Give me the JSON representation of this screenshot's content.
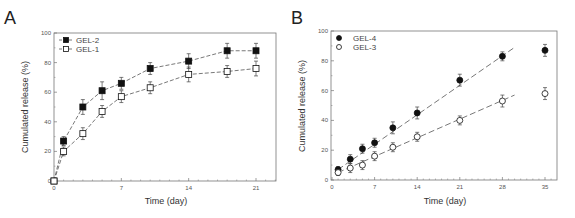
{
  "chart_data": [
    {
      "panel": "A",
      "type": "line",
      "title": "",
      "xlabel": "Time (day)",
      "ylabel": "Cumulated release (%)",
      "xlim": [
        0,
        24
      ],
      "ylim": [
        0,
        100
      ],
      "xticks": [
        0,
        7,
        14,
        21
      ],
      "yticks": [
        0,
        20,
        40,
        60,
        80,
        100
      ],
      "grid": false,
      "legend_position": "upper-left",
      "series": [
        {
          "name": "GEL-2",
          "marker": "filled-square",
          "line": "dashed",
          "x": [
            0,
            1,
            3,
            5,
            7,
            10,
            14,
            18,
            21
          ],
          "y": [
            0,
            27,
            50,
            61,
            66,
            76,
            81,
            88,
            88
          ],
          "err": [
            0,
            3,
            5,
            6,
            4,
            4,
            5,
            5,
            5
          ]
        },
        {
          "name": "GEL-1",
          "marker": "open-square",
          "line": "dashed",
          "x": [
            0,
            1,
            3,
            5,
            7,
            10,
            14,
            18,
            21
          ],
          "y": [
            0,
            20,
            32,
            47,
            57,
            63,
            72,
            74,
            76
          ],
          "err": [
            0,
            3,
            4,
            4,
            4,
            4,
            5,
            4,
            5
          ]
        }
      ],
      "frame": {
        "left": 54,
        "top": 33,
        "right": 276,
        "bottom": 181,
        "x0px": 54,
        "x21px": 256
      }
    },
    {
      "panel": "B",
      "type": "scatter",
      "title": "",
      "xlabel": "Time (day)",
      "ylabel": "Cumulated release (%)",
      "xlim": [
        0,
        37
      ],
      "ylim": [
        0,
        100
      ],
      "xticks": [
        0,
        7,
        14,
        21,
        28,
        35
      ],
      "yticks": [
        0,
        20,
        40,
        60,
        80,
        100
      ],
      "grid": false,
      "legend_position": "upper-left",
      "series": [
        {
          "name": "GEL-4",
          "marker": "filled-circle",
          "x": [
            1,
            3,
            5,
            7,
            10,
            14,
            21,
            28,
            35
          ],
          "y": [
            7,
            14,
            21,
            25,
            35,
            45,
            67,
            83,
            87
          ],
          "err": [
            2,
            3,
            3,
            3,
            4,
            4,
            4,
            3,
            4
          ],
          "fit": {
            "x": [
              1,
              30
            ],
            "y": [
              7,
              89
            ]
          }
        },
        {
          "name": "GEL-3",
          "marker": "open-circle",
          "x": [
            1,
            3,
            5,
            7,
            10,
            14,
            21,
            28,
            35
          ],
          "y": [
            5,
            8,
            10,
            16,
            22,
            29,
            40,
            53,
            58
          ],
          "err": [
            2,
            3,
            3,
            3,
            3,
            3,
            3,
            4,
            4
          ],
          "fit": {
            "x": [
              1,
              30
            ],
            "y": [
              5,
              57
            ]
          }
        }
      ],
      "frame": {
        "left": 331,
        "top": 31,
        "right": 557,
        "bottom": 180,
        "x0px": 332,
        "x35px": 545
      }
    }
  ],
  "panels": {
    "a": {
      "letter": "A",
      "xlabel": "Time (day)",
      "ylabel": "Cumulated release (%)",
      "legend": [
        "GEL-2",
        "GEL-1"
      ]
    },
    "b": {
      "letter": "B",
      "xlabel": "Time (day)",
      "ylabel": "Cumulated release (%)",
      "legend": [
        "GEL-4",
        "GEL-3"
      ]
    }
  },
  "colors": {
    "axis": "#777777",
    "marker": "#111111",
    "line": "#555555",
    "text": "#333333"
  }
}
